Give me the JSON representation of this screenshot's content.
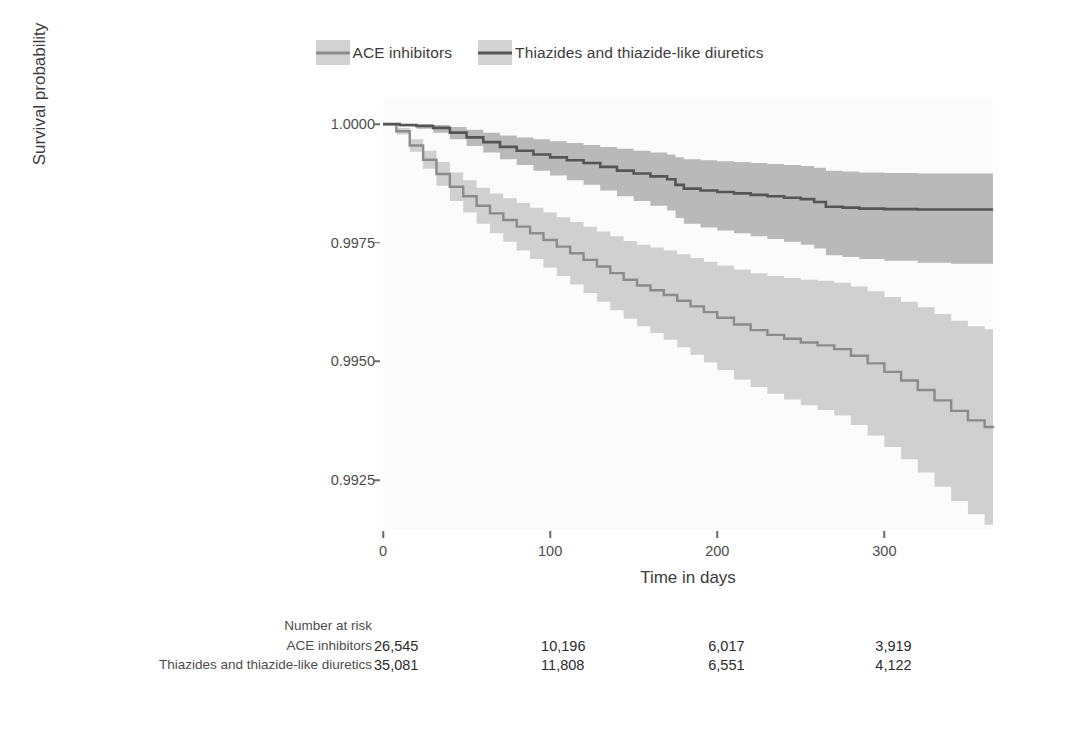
{
  "chart_data": {
    "type": "line",
    "subtype": "kaplan-meier-survival",
    "title": "",
    "xlabel": "Time in days",
    "ylabel": "Survival probability",
    "xlim": [
      0,
      365
    ],
    "ylim": [
      0.99145,
      1.00055
    ],
    "grid": false,
    "legend_position": "top-center",
    "xticks": [
      0,
      100,
      200,
      300
    ],
    "xtick_labels": [
      "0",
      "100",
      "200",
      "300"
    ],
    "yticks": [
      1.0,
      0.9975,
      0.995,
      0.9925
    ],
    "ytick_labels": [
      "1.0000",
      "0.9975",
      "0.9950",
      "0.9925"
    ],
    "legend": [
      "ACE inhibitors",
      "Thiazides and thiazide-like diuretics"
    ],
    "colors": {
      "ace_line": "#8b8b8b",
      "thiazide_line": "#555555",
      "ace_band": "#d0d0d0",
      "thiazide_band": "#b9b9b9",
      "panel_background": "#fbfbfb",
      "axis_text": "#4d4d4d"
    },
    "series": [
      {
        "name": "ACE inhibitors",
        "x": [
          0,
          8,
          16,
          24,
          32,
          40,
          48,
          56,
          64,
          72,
          80,
          88,
          96,
          104,
          112,
          120,
          128,
          136,
          144,
          152,
          160,
          168,
          176,
          184,
          192,
          200,
          210,
          220,
          230,
          240,
          250,
          260,
          270,
          280,
          290,
          300,
          310,
          320,
          330,
          340,
          350,
          360,
          365
        ],
        "y": [
          1.0,
          0.99985,
          0.99955,
          0.99925,
          0.99895,
          0.99868,
          0.99848,
          0.99828,
          0.99812,
          0.99798,
          0.99784,
          0.9977,
          0.99756,
          0.99742,
          0.99728,
          0.99714,
          0.997,
          0.99686,
          0.99672,
          0.9966,
          0.9965,
          0.9964,
          0.99628,
          0.99616,
          0.99604,
          0.99592,
          0.99578,
          0.99566,
          0.99556,
          0.99548,
          0.9954,
          0.99534,
          0.99526,
          0.99512,
          0.99496,
          0.99478,
          0.9946,
          0.9944,
          0.99418,
          0.99396,
          0.99376,
          0.99362,
          0.9936
        ],
        "ci_lower": [
          1.0,
          0.99978,
          0.99942,
          0.99906,
          0.9987,
          0.99838,
          0.99814,
          0.9979,
          0.9977,
          0.99752,
          0.99734,
          0.99716,
          0.99698,
          0.9968,
          0.99662,
          0.99644,
          0.99626,
          0.99608,
          0.9959,
          0.99574,
          0.9956,
          0.99546,
          0.9953,
          0.99514,
          0.99498,
          0.99482,
          0.99462,
          0.99446,
          0.99432,
          0.9942,
          0.99408,
          0.99398,
          0.99386,
          0.99366,
          0.99344,
          0.9932,
          0.99294,
          0.99266,
          0.99236,
          0.99206,
          0.99178,
          0.99156,
          0.9915
        ],
        "ci_upper": [
          1.0,
          0.99992,
          0.99968,
          0.99944,
          0.9992,
          0.99898,
          0.99882,
          0.99866,
          0.99854,
          0.99844,
          0.99834,
          0.99824,
          0.99814,
          0.99804,
          0.99794,
          0.99784,
          0.99774,
          0.99764,
          0.99754,
          0.99746,
          0.9974,
          0.99734,
          0.99726,
          0.99718,
          0.9971,
          0.99702,
          0.99694,
          0.99686,
          0.9968,
          0.99676,
          0.99672,
          0.9967,
          0.99666,
          0.99658,
          0.99648,
          0.99636,
          0.99626,
          0.99614,
          0.996,
          0.99586,
          0.99574,
          0.99568,
          0.99566
        ]
      },
      {
        "name": "Thiazides and thiazide-like diuretics",
        "x": [
          0,
          10,
          20,
          30,
          40,
          50,
          60,
          70,
          80,
          90,
          100,
          110,
          120,
          130,
          140,
          150,
          160,
          170,
          175,
          180,
          190,
          200,
          210,
          220,
          230,
          240,
          250,
          258,
          265,
          275,
          285,
          300,
          320,
          340,
          365
        ],
        "y": [
          1.0,
          0.99998,
          0.99996,
          0.99992,
          0.99982,
          0.99972,
          0.99962,
          0.99952,
          0.99944,
          0.99936,
          0.9993,
          0.99924,
          0.99918,
          0.9991,
          0.99902,
          0.99896,
          0.9989,
          0.99884,
          0.99872,
          0.99864,
          0.9986,
          0.99857,
          0.99854,
          0.99851,
          0.99848,
          0.99845,
          0.99842,
          0.99836,
          0.99826,
          0.99824,
          0.99822,
          0.99821,
          0.9982,
          0.9982,
          0.9982
        ],
        "ci_lower": [
          1.0,
          0.99995,
          0.9999,
          0.99982,
          0.99968,
          0.99954,
          0.9994,
          0.99926,
          0.99914,
          0.99902,
          0.99892,
          0.99882,
          0.99872,
          0.9986,
          0.99848,
          0.99838,
          0.99828,
          0.99818,
          0.99802,
          0.9979,
          0.99782,
          0.99776,
          0.9977,
          0.99764,
          0.99758,
          0.99752,
          0.99746,
          0.99738,
          0.99724,
          0.9972,
          0.99716,
          0.99712,
          0.99708,
          0.99706,
          0.99706
        ],
        "ci_upper": [
          1.0,
          1.0,
          1.0,
          0.99998,
          0.99994,
          0.99988,
          0.99982,
          0.99976,
          0.99972,
          0.99968,
          0.99964,
          0.9996,
          0.99956,
          0.99952,
          0.99948,
          0.99944,
          0.9994,
          0.99936,
          0.9993,
          0.99926,
          0.99924,
          0.99922,
          0.9992,
          0.99918,
          0.99916,
          0.99914,
          0.99912,
          0.99908,
          0.99902,
          0.999,
          0.99898,
          0.99897,
          0.99896,
          0.99896,
          0.99896
        ]
      }
    ]
  },
  "legend": {
    "entries": [
      {
        "label": "ACE inhibitors",
        "swatch": "ace"
      },
      {
        "label": "Thiazides and thiazide-like diuretics",
        "swatch": "thia"
      }
    ]
  },
  "axes": {
    "y_title": "Survival probability",
    "x_title": "Time in days",
    "y_tick_labels": [
      "1.0000",
      "0.9975",
      "0.9950",
      "0.9925"
    ],
    "x_tick_labels": [
      "0",
      "100",
      "200",
      "300"
    ]
  },
  "risk_table": {
    "header": "Number at risk",
    "rows": [
      {
        "label": "ACE inhibitors",
        "values": [
          "26,545",
          "10,196",
          "6,017",
          "3,919"
        ]
      },
      {
        "label": "Thiazides and thiazide-like diuretics",
        "values": [
          "35,081",
          "11,808",
          "6,551",
          "4,122"
        ]
      }
    ]
  }
}
